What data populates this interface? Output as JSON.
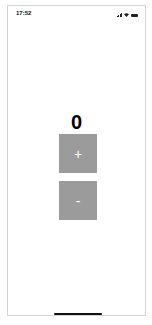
{
  "status_bar": {
    "time": "17:52",
    "icons": [
      "signal-icon",
      "wifi-icon",
      "battery-icon"
    ]
  },
  "counter": {
    "value": "0"
  },
  "buttons": {
    "increment_label": "+",
    "decrement_label": "-"
  },
  "colors": {
    "button_bg": "#9b9b9b",
    "button_text": "#ffffff",
    "counter_text": "#000000"
  }
}
